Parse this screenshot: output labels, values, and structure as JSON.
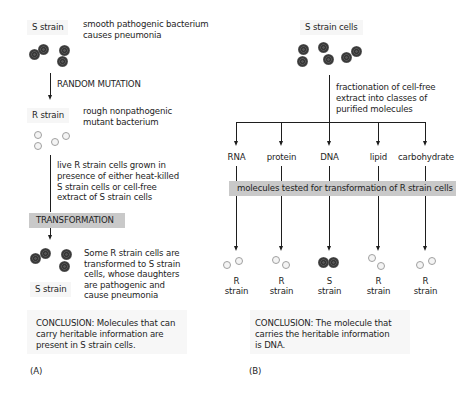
{
  "panelA": {
    "panel_label": "(A)",
    "s_strain_label": "S strain",
    "s_strain_desc": [
      "smooth pathogenic bacterium",
      "causes pneumonia"
    ],
    "mutation_label": "RANDOM MUTATION",
    "r_strain_label": "R strain",
    "r_strain_desc": [
      "rough nonpathogenic",
      "mutant bacterium"
    ],
    "growth_desc": [
      "live R strain cells grown in",
      "presence of either heat-killed",
      "S strain cells or cell-free",
      "extract of S strain cells"
    ],
    "transformation_label": "TRANSFORMATION",
    "result_desc": [
      "Some R strain cells are",
      "transformed to S strain",
      "cells, whose daughters",
      "are pathogenic and",
      "cause pneumonia"
    ],
    "result_label": "S strain",
    "conclusion": [
      "CONCLUSION: Molecules that can",
      "carry heritable information are",
      "present in S strain cells."
    ]
  },
  "panelB": {
    "panel_label": "(B)",
    "source_label": "S strain cells",
    "fractionation_desc": [
      "fractionation of cell-free",
      "extract into classes of",
      "purified molecules"
    ],
    "test_bar_label": "molecules tested for transformation of R strain cells",
    "fractions": [
      {
        "molecule": "RNA",
        "result_letter": "R",
        "result_word": "strain",
        "cell_type": "R"
      },
      {
        "molecule": "protein",
        "result_letter": "R",
        "result_word": "strain",
        "cell_type": "R"
      },
      {
        "molecule": "DNA",
        "result_letter": "S",
        "result_word": "strain",
        "cell_type": "S"
      },
      {
        "molecule": "lipid",
        "result_letter": "R",
        "result_word": "strain",
        "cell_type": "R"
      },
      {
        "molecule": "carbohydrate",
        "result_letter": "R",
        "result_word": "strain",
        "cell_type": "R"
      }
    ],
    "conclusion": [
      "CONCLUSION: The molecule that",
      "carries the heritable information",
      "is DNA."
    ]
  },
  "colors": {
    "gray_bar": "#c9c9c9",
    "label_box": "#f6f6f6",
    "line": "#1e1e1e",
    "s_cell": "#3a3a3a",
    "r_cell_outline": "#a0a0a0"
  }
}
